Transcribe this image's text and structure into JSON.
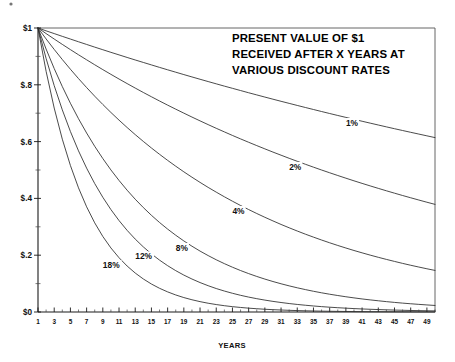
{
  "chart_data": {
    "type": "line",
    "title_lines": [
      "PRESENT VALUE OF $1",
      "RECEIVED AFTER X YEARS AT",
      "VARIOUS DISCOUNT RATES"
    ],
    "xlabel": "YEARS",
    "ylabel": "",
    "xlim": [
      1,
      50
    ],
    "ylim": [
      0,
      1
    ],
    "grid": false,
    "legend_position": "inline-on-curves",
    "y_tick_labels": [
      "$0",
      "$.2",
      "$.4",
      "$.6",
      "$.8",
      "$1"
    ],
    "y_tick_values": [
      0,
      0.2,
      0.4,
      0.6,
      0.8,
      1
    ],
    "y_minor_tick_values": [
      0.1,
      0.3,
      0.5,
      0.7,
      0.9
    ],
    "x_tick_labels": [
      "1",
      "3",
      "5",
      "7",
      "9",
      "11",
      "13",
      "15",
      "17",
      "19",
      "21",
      "23",
      "25",
      "27",
      "29",
      "31",
      "33",
      "35",
      "37",
      "39",
      "41",
      "43",
      "45",
      "47",
      "49"
    ],
    "x_tick_values": [
      1,
      3,
      5,
      7,
      9,
      11,
      13,
      15,
      17,
      19,
      21,
      23,
      25,
      27,
      29,
      31,
      33,
      35,
      37,
      39,
      41,
      43,
      45,
      47,
      49
    ],
    "x": [
      1,
      2,
      3,
      4,
      5,
      6,
      7,
      8,
      9,
      10,
      11,
      12,
      13,
      14,
      15,
      16,
      17,
      18,
      19,
      20,
      21,
      22,
      23,
      24,
      25,
      26,
      27,
      28,
      29,
      30,
      31,
      32,
      33,
      34,
      35,
      36,
      37,
      38,
      39,
      40,
      41,
      42,
      43,
      44,
      45,
      46,
      47,
      48,
      49,
      50
    ],
    "series": [
      {
        "name": "1%",
        "rate": 0.01,
        "label_x": 39,
        "label_y": 0.655,
        "values": [
          1,
          0.99,
          0.9803,
          0.9706,
          0.9611,
          0.9515,
          0.9421,
          0.9327,
          0.9235,
          0.9143,
          0.9053,
          0.8963,
          0.8874,
          0.8787,
          0.87,
          0.8613,
          0.8528,
          0.8444,
          0.836,
          0.8277,
          0.8195,
          0.8114,
          0.8034,
          0.7954,
          0.7876,
          0.7798,
          0.772,
          0.7644,
          0.7568,
          0.7493,
          0.7419,
          0.7346,
          0.7273,
          0.7201,
          0.713,
          0.7059,
          0.6989,
          0.692,
          0.6852,
          0.6784,
          0.6717,
          0.665,
          0.6584,
          0.6519,
          0.6454,
          0.6391,
          0.6327,
          0.6265,
          0.6203,
          0.6141
        ]
      },
      {
        "name": "2%",
        "rate": 0.02,
        "label_x": 32,
        "label_y": 0.5,
        "values": [
          1,
          0.9804,
          0.9612,
          0.9423,
          0.9238,
          0.9057,
          0.888,
          0.8706,
          0.8535,
          0.8368,
          0.8203,
          0.8043,
          0.7885,
          0.773,
          0.7579,
          0.743,
          0.7284,
          0.7142,
          0.7002,
          0.6864,
          0.673,
          0.6598,
          0.6468,
          0.6342,
          0.6217,
          0.6095,
          0.5976,
          0.5859,
          0.5744,
          0.5631,
          0.5521,
          0.5412,
          0.5306,
          0.5202,
          0.51,
          0.5,
          0.4902,
          0.4806,
          0.4712,
          0.4619,
          0.4529,
          0.444,
          0.4353,
          0.4268,
          0.4184,
          0.4102,
          0.4022,
          0.3943,
          0.3865,
          0.379
        ]
      },
      {
        "name": "4%",
        "rate": 0.04,
        "label_x": 25,
        "label_y": 0.345,
        "values": [
          1,
          0.9615,
          0.9246,
          0.889,
          0.8548,
          0.8219,
          0.7903,
          0.7599,
          0.7307,
          0.7026,
          0.6756,
          0.6496,
          0.6246,
          0.6006,
          0.5775,
          0.5553,
          0.5339,
          0.5134,
          0.4936,
          0.4746,
          0.4564,
          0.4388,
          0.422,
          0.4057,
          0.3901,
          0.3751,
          0.3607,
          0.3468,
          0.3335,
          0.3207,
          0.3083,
          0.2965,
          0.2851,
          0.2741,
          0.2636,
          0.2534,
          0.2437,
          0.2343,
          0.2253,
          0.2166,
          0.2083,
          0.2003,
          0.1926,
          0.1852,
          0.1781,
          0.1712,
          0.1646,
          0.1583,
          0.1522,
          0.1464
        ]
      },
      {
        "name": "8%",
        "rate": 0.08,
        "label_x": 18,
        "label_y": 0.215,
        "values": [
          1,
          0.9259,
          0.8573,
          0.7938,
          0.735,
          0.6806,
          0.6302,
          0.5835,
          0.5403,
          0.5002,
          0.4632,
          0.4289,
          0.3971,
          0.3677,
          0.3405,
          0.3152,
          0.2919,
          0.2703,
          0.2502,
          0.2317,
          0.2145,
          0.1987,
          0.1839,
          0.1703,
          0.1577,
          0.146,
          0.1352,
          0.1252,
          0.1159,
          0.1073,
          0.0994,
          0.092,
          0.0852,
          0.0789,
          0.073,
          0.0676,
          0.0626,
          0.058,
          0.0537,
          0.0497,
          0.046,
          0.0426,
          0.0395,
          0.0365,
          0.0338,
          0.0313,
          0.029,
          0.0269,
          0.0249,
          0.023
        ]
      },
      {
        "name": "12%",
        "rate": 0.12,
        "label_x": 13,
        "label_y": 0.185,
        "values": [
          1,
          0.8929,
          0.7972,
          0.7118,
          0.6355,
          0.5674,
          0.5066,
          0.4523,
          0.4039,
          0.3606,
          0.322,
          0.2875,
          0.2567,
          0.2292,
          0.2046,
          0.1827,
          0.1631,
          0.1456,
          0.13,
          0.1161,
          0.1037,
          0.0926,
          0.0826,
          0.0738,
          0.0659,
          0.0588,
          0.0525,
          0.0469,
          0.0419,
          0.0374,
          0.0334,
          0.0298,
          0.0266,
          0.0238,
          0.0212,
          0.0189,
          0.0169,
          0.0151,
          0.0135,
          0.012,
          0.0107,
          0.0096,
          0.0086,
          0.0076,
          0.0068,
          0.0061,
          0.0054,
          0.0049,
          0.0043,
          0.0039
        ]
      },
      {
        "name": "18%",
        "rate": 0.18,
        "label_x": 9,
        "label_y": 0.155,
        "values": [
          1,
          0.8475,
          0.7182,
          0.6086,
          0.5158,
          0.4371,
          0.3704,
          0.3139,
          0.266,
          0.2255,
          0.1911,
          0.1619,
          0.1372,
          0.1163,
          0.0985,
          0.0835,
          0.0708,
          0.06,
          0.0508,
          0.0431,
          0.0365,
          0.0309,
          0.0262,
          0.0222,
          0.0188,
          0.016,
          0.0135,
          0.0115,
          0.0097,
          0.0082,
          0.007,
          0.0059,
          0.005,
          0.0042,
          0.0036,
          0.003,
          0.0026,
          0.0022,
          0.0019,
          0.0016,
          0.0013,
          0.0011,
          0.001,
          0.0008,
          0.0007,
          0.0006,
          0.0005,
          0.0004,
          0.0004,
          0.0003
        ]
      }
    ]
  }
}
